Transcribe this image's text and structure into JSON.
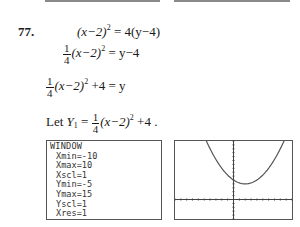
{
  "problem": {
    "number": "77.",
    "steps": [
      {
        "lhs": "(x−2)",
        "exp": "2",
        "rhs": " = 4(y−4)"
      },
      {
        "frac_num": "1",
        "frac_den": "4",
        "lhs": "(x−2)",
        "exp": "2",
        "rhs": " = y−4"
      },
      {
        "frac_num": "1",
        "frac_den": "4",
        "lhs": "(x−2)",
        "exp": "2",
        "rhs": " +4 = y"
      }
    ],
    "let_line": {
      "prefix": "Let ",
      "var": "Y",
      "sub": "1",
      "eq": " = ",
      "frac_num": "1",
      "frac_den": "4",
      "expr": "(x−2)",
      "exp": "2",
      "suffix": " +4 ."
    }
  },
  "window_screen": {
    "title": "WINDOW",
    "rows": [
      "Xmin=-10",
      "Xmax=10",
      "Xscl=1",
      "Ymin=-5",
      "Ymax=15",
      "Yscl=1",
      "Xres=1"
    ]
  },
  "graph_screen": {
    "function": "Y1 = 1/4(x-2)^2 + 4",
    "xmin": -10,
    "xmax": 10,
    "xscl": 1,
    "ymin": -5,
    "ymax": 15,
    "yscl": 1,
    "vertex": [
      2,
      4
    ],
    "y_intercept": 5
  }
}
